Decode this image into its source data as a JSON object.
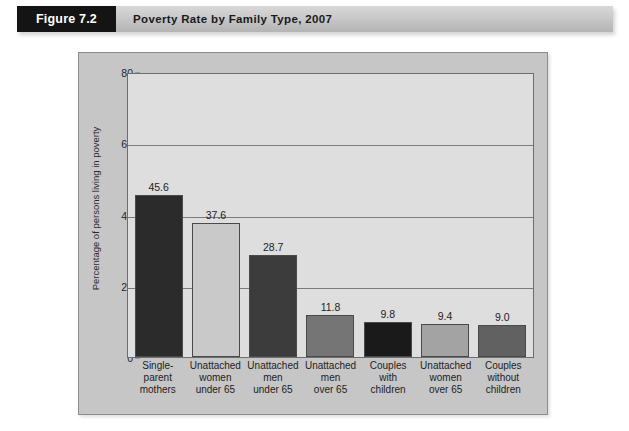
{
  "header": {
    "figure_tag": "Figure 7.2",
    "title": "Poverty Rate by Family Type, 2007"
  },
  "chart_data": {
    "type": "bar",
    "title": "Poverty Rate by Family Type, 2007",
    "xlabel": "",
    "ylabel": "Percentage of persons living in poverty",
    "ylim": [
      0,
      80
    ],
    "yticks": [
      0,
      20,
      40,
      60,
      80
    ],
    "ytick_labels": [
      "0",
      "20",
      "40",
      "60",
      "80"
    ],
    "grid": true,
    "legend": "none",
    "categories": [
      "Single-parent mothers",
      "Unattached women under 65",
      "Unattached men under 65",
      "Unattached men over 65",
      "Couples with children",
      "Unattached women over 65",
      "Couples without children"
    ],
    "category_lines": [
      [
        "Single-",
        "parent",
        "mothers"
      ],
      [
        "Unattached",
        "women",
        "under 65"
      ],
      [
        "Unattached",
        "men",
        "under 65"
      ],
      [
        "Unattached",
        "men",
        "over 65"
      ],
      [
        "Couples",
        "with",
        "children"
      ],
      [
        "Unattached",
        "women",
        "over 65"
      ],
      [
        "Couples",
        "without",
        "children"
      ]
    ],
    "values": [
      45.6,
      37.6,
      28.7,
      11.8,
      9.8,
      9.4,
      9.0
    ],
    "value_labels": [
      "45.6",
      "37.6",
      "28.7",
      "11.8",
      "9.8",
      "9.4",
      "9.0"
    ],
    "bar_colors": [
      "#2b2b2b",
      "#c9c9c9",
      "#3c3c3c",
      "#757575",
      "#1a1a1a",
      "#a3a3a3",
      "#616161"
    ]
  },
  "colors": {
    "panel_background": "#c6c6c6",
    "plot_background": "#dedede",
    "header_tag_background": "#141414",
    "header_bar_background": "#c9c9c9",
    "axis_line": "#6d6d6d",
    "gridline": "#7b7b7b"
  }
}
